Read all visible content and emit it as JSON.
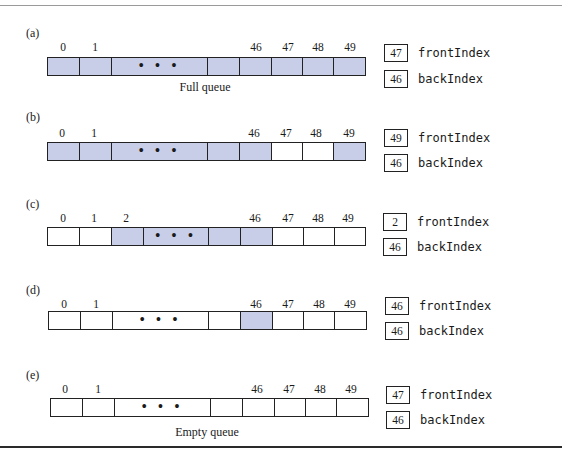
{
  "figure": {
    "fill_color": "#c8cde8",
    "border_color": "#222222",
    "variables": [
      "frontIndex",
      "backIndex"
    ],
    "panels": [
      {
        "id": "a",
        "label": "(a)",
        "caption": "Full queue",
        "frontIndex": "47",
        "backIndex": "46",
        "front_label": "frontIndex",
        "back_label": "backIndex",
        "index_labels": [
          "0",
          "1",
          "46",
          "47",
          "48",
          "49"
        ],
        "cells": [
          {
            "index": "0",
            "filled": true
          },
          {
            "index": "1",
            "filled": true
          },
          {
            "index": "...",
            "filled": true,
            "ellipsis": true
          },
          {
            "index": "",
            "filled": true
          },
          {
            "index": "46",
            "filled": true
          },
          {
            "index": "47",
            "filled": true
          },
          {
            "index": "48",
            "filled": true
          },
          {
            "index": "49",
            "filled": true
          }
        ]
      },
      {
        "id": "b",
        "label": "(b)",
        "caption": "",
        "frontIndex": "49",
        "backIndex": "46",
        "front_label": "frontIndex",
        "back_label": "backIndex",
        "index_labels": [
          "0",
          "1",
          "46",
          "47",
          "48",
          "49"
        ],
        "cells": [
          {
            "index": "0",
            "filled": true
          },
          {
            "index": "1",
            "filled": true
          },
          {
            "index": "...",
            "filled": true,
            "ellipsis": true
          },
          {
            "index": "",
            "filled": true
          },
          {
            "index": "46",
            "filled": true
          },
          {
            "index": "47",
            "filled": false
          },
          {
            "index": "48",
            "filled": false
          },
          {
            "index": "49",
            "filled": true
          }
        ]
      },
      {
        "id": "c",
        "label": "(c)",
        "caption": "",
        "frontIndex": "2",
        "backIndex": "46",
        "front_label": "frontIndex",
        "back_label": "backIndex",
        "index_labels": [
          "0",
          "1",
          "2",
          "46",
          "47",
          "48",
          "49"
        ],
        "cells": [
          {
            "index": "0",
            "filled": false
          },
          {
            "index": "1",
            "filled": false
          },
          {
            "index": "2",
            "filled": true
          },
          {
            "index": "...",
            "filled": true,
            "ellipsis": true
          },
          {
            "index": "",
            "filled": true
          },
          {
            "index": "46",
            "filled": true
          },
          {
            "index": "47",
            "filled": false
          },
          {
            "index": "48",
            "filled": false
          },
          {
            "index": "49",
            "filled": false
          }
        ]
      },
      {
        "id": "d",
        "label": "(d)",
        "caption": "",
        "frontIndex": "46",
        "backIndex": "46",
        "front_label": "frontIndex",
        "back_label": "backIndex",
        "index_labels": [
          "0",
          "1",
          "46",
          "47",
          "48",
          "49"
        ],
        "cells": [
          {
            "index": "0",
            "filled": false
          },
          {
            "index": "1",
            "filled": false
          },
          {
            "index": "...",
            "filled": false,
            "ellipsis": true
          },
          {
            "index": "",
            "filled": false
          },
          {
            "index": "46",
            "filled": true
          },
          {
            "index": "47",
            "filled": false
          },
          {
            "index": "48",
            "filled": false
          },
          {
            "index": "49",
            "filled": false
          }
        ]
      },
      {
        "id": "e",
        "label": "(e)",
        "caption": "Empty queue",
        "frontIndex": "47",
        "backIndex": "46",
        "front_label": "frontIndex",
        "back_label": "backIndex",
        "index_labels": [
          "0",
          "1",
          "46",
          "47",
          "48",
          "49"
        ],
        "cells": [
          {
            "index": "0",
            "filled": false
          },
          {
            "index": "1",
            "filled": false
          },
          {
            "index": "...",
            "filled": false,
            "ellipsis": true
          },
          {
            "index": "",
            "filled": false
          },
          {
            "index": "46",
            "filled": false
          },
          {
            "index": "47",
            "filled": false
          },
          {
            "index": "48",
            "filled": false
          },
          {
            "index": "49",
            "filled": false
          }
        ]
      }
    ],
    "ellipsis_text": "• • •"
  }
}
